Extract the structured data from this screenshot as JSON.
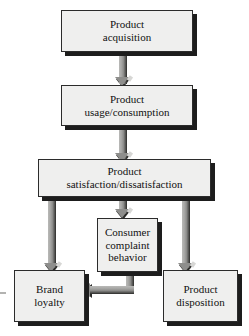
{
  "diagram": {
    "background_color": "#ffffff",
    "box_fill_color": "#efefee",
    "box_border_color": "#2b2b2b",
    "shadow_color": "#1d1d1d",
    "arrow_color": "#8e8e8c",
    "text_color": "#111111"
  },
  "nodes": [
    {
      "id": "product-acquisition",
      "label": "Product\nacquisition",
      "line1": "Product",
      "line2": "acquisition"
    },
    {
      "id": "product-usage-consumption",
      "label": "Product\nusage/consumption",
      "line1": "Product",
      "line2": "usage/consumption"
    },
    {
      "id": "product-satisfaction-dissatisfaction",
      "label": "Product\nsatisfaction/dissatisfaction",
      "line1": "Product",
      "line2": "satisfaction/dissatisfaction"
    },
    {
      "id": "consumer-complaint-behavior",
      "label": "Consumer\ncomplaint\nbehavior",
      "line1": "Consumer",
      "line2": "complaint",
      "line3": "behavior"
    },
    {
      "id": "brand-loyalty",
      "label": "Brand\nloyalty",
      "line1": "Brand",
      "line2": "loyalty"
    },
    {
      "id": "product-disposition",
      "label": "Product\ndisposition",
      "line1": "Product",
      "line2": "disposition"
    }
  ],
  "connectors": [
    {
      "id": "acquisition-to-usage",
      "from": "product-acquisition",
      "to": "product-usage-consumption",
      "direction": "down"
    },
    {
      "id": "usage-to-satisfaction",
      "from": "product-usage-consumption",
      "to": "product-satisfaction-dissatisfaction",
      "direction": "down"
    },
    {
      "id": "satisfaction-to-complaint",
      "from": "product-satisfaction-dissatisfaction",
      "to": "consumer-complaint-behavior",
      "direction": "down"
    },
    {
      "id": "satisfaction-to-brand-loyalty",
      "from": "product-satisfaction-dissatisfaction",
      "to": "brand-loyalty",
      "direction": "down"
    },
    {
      "id": "satisfaction-to-product-disposition",
      "from": "product-satisfaction-dissatisfaction",
      "to": "product-disposition",
      "direction": "down"
    },
    {
      "id": "complaint-to-brand-loyalty",
      "from": "consumer-complaint-behavior",
      "to": "brand-loyalty",
      "direction": "down-then-left"
    }
  ]
}
